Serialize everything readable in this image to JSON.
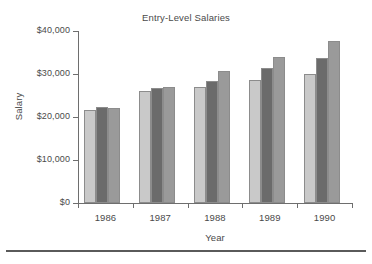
{
  "figure": {
    "clipped_header_text": "",
    "bottom_rule": "horizontal-rule"
  },
  "axis_titles": {
    "x": "Year",
    "y": "Salary"
  },
  "chart_data": {
    "type": "bar",
    "title": "Entry-Level Salaries",
    "xlabel": "Year",
    "ylabel": "Salary",
    "categories": [
      "1986",
      "1987",
      "1988",
      "1989",
      "1990"
    ],
    "ylim": [
      0,
      40000
    ],
    "yticks": [
      0,
      10000,
      20000,
      30000,
      40000
    ],
    "ytick_labels": [
      "$0",
      "$10,000",
      "$20,000",
      "$30,000",
      "$40,000"
    ],
    "grid": false,
    "legend": "none",
    "series": [
      {
        "name": "series-1",
        "color": "#c9c9c9",
        "values": [
          21600,
          26000,
          27000,
          28500,
          30000
        ]
      },
      {
        "name": "series-2",
        "color": "#6b6b6b",
        "values": [
          22300,
          26700,
          28400,
          31500,
          33700
        ]
      },
      {
        "name": "series-3",
        "color": "#9a9a9a",
        "values": [
          22000,
          27000,
          30800,
          34000,
          37700
        ]
      }
    ]
  }
}
